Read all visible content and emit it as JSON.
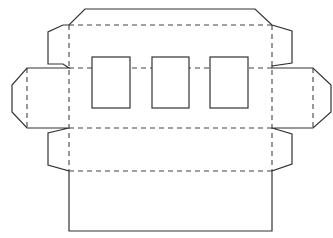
{
  "diagram": {
    "type": "box-dieline",
    "colors": {
      "cut_line": "#333333",
      "fold_line": "#444444",
      "background": "#ffffff"
    },
    "cut_outline": [
      [
        85,
        9
      ],
      [
        255,
        9
      ],
      [
        272,
        25
      ],
      [
        292,
        31
      ],
      [
        292,
        63
      ],
      [
        272,
        66
      ],
      [
        272,
        68
      ],
      [
        313,
        68
      ],
      [
        331,
        85
      ],
      [
        331,
        112
      ],
      [
        313,
        128
      ],
      [
        272,
        128
      ],
      [
        292,
        134
      ],
      [
        292,
        164
      ],
      [
        272,
        171
      ],
      [
        272,
        231
      ],
      [
        69,
        231
      ],
      [
        69,
        171
      ],
      [
        48,
        165
      ],
      [
        48,
        133
      ],
      [
        69,
        128
      ],
      [
        27,
        128
      ],
      [
        12,
        112
      ],
      [
        12,
        85
      ],
      [
        27,
        68
      ],
      [
        69,
        68
      ],
      [
        63,
        64
      ],
      [
        48,
        64
      ],
      [
        48,
        32
      ],
      [
        63,
        25
      ],
      [
        69,
        25
      ]
    ],
    "fold_lines": [
      {
        "x1": 69,
        "y1": 25,
        "x2": 272,
        "y2": 25
      },
      {
        "x1": 69,
        "y1": 68,
        "x2": 272,
        "y2": 68
      },
      {
        "x1": 69,
        "y1": 128,
        "x2": 272,
        "y2": 128
      },
      {
        "x1": 69,
        "y1": 171,
        "x2": 272,
        "y2": 171
      },
      {
        "x1": 69,
        "y1": 25,
        "x2": 69,
        "y2": 171
      },
      {
        "x1": 272,
        "y1": 25,
        "x2": 272,
        "y2": 171
      },
      {
        "x1": 27,
        "y1": 68,
        "x2": 27,
        "y2": 128
      },
      {
        "x1": 313,
        "y1": 68,
        "x2": 313,
        "y2": 128
      }
    ],
    "windows": [
      {
        "label": "window-1",
        "x": 92,
        "y": 57,
        "w": 38,
        "h": 51
      },
      {
        "label": "window-2",
        "x": 152,
        "y": 57,
        "w": 37,
        "h": 51
      },
      {
        "label": "window-3",
        "x": 210,
        "y": 57,
        "w": 38,
        "h": 51
      }
    ]
  }
}
